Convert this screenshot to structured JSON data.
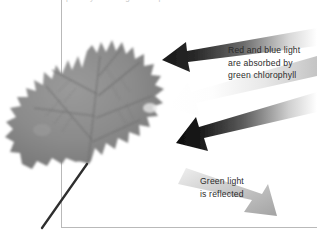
{
  "figure": {
    "title_sliver": "photosynthesis light absorption in a leaf",
    "background_color": "#ffffff",
    "border_color": "#b9b9b9",
    "text_color": "#2b2b2b"
  },
  "subject": {
    "name": "leaf",
    "description": "grayscale photograph of a lobed maple-like leaf with visible veins and a long dark stem",
    "body_color": "#8a8a8a",
    "vein_color": "#6e6e6e",
    "stem_color": "#2e2e2e"
  },
  "annotations": [
    {
      "id": "absorbed",
      "lines": [
        "Red and blue light",
        "are absorbed by",
        "green chlorophyll"
      ]
    },
    {
      "id": "reflected",
      "lines": [
        "Green light",
        "is reflected"
      ]
    }
  ],
  "arrows": [
    {
      "id": "incoming-dark-1",
      "label": "red and blue light ray absorbed",
      "direction": "left",
      "color": "#1c1c1c"
    },
    {
      "id": "incoming-white",
      "label": "white light ray entering leaf",
      "direction": "left-down",
      "color": "#fdfdfd"
    },
    {
      "id": "incoming-dark-2",
      "label": "red and blue light ray absorbed",
      "direction": "left-down",
      "color": "#111111"
    },
    {
      "id": "outgoing-green",
      "label": "green light reflected away",
      "direction": "right-down",
      "color": "#b0b0b0"
    }
  ]
}
